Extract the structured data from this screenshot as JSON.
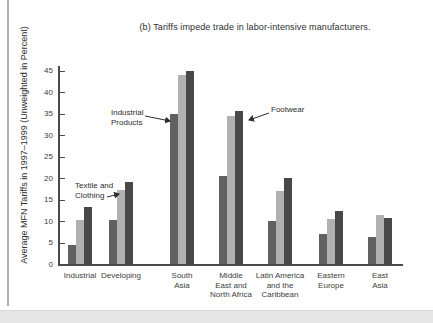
{
  "figure": {
    "title": "(b) Tariffs impede trade in labor-intensive manufacturers."
  },
  "chart_data": {
    "type": "bar",
    "title": "(b) Tariffs impede trade in labor-intensive manufacturers.",
    "xlabel": "",
    "ylabel": "Average MFN Tariffs in 1997–1999 (Unweighted in Percent)",
    "ylim": [
      0,
      45
    ],
    "yticks": [
      0,
      5,
      10,
      15,
      20,
      25,
      30,
      35,
      40,
      45
    ],
    "grid": false,
    "legend_position": "none (labeled by arrow annotations)",
    "categories": [
      "Industrial",
      "Developing",
      "South\nAsia",
      "Middle\nEast and\nNorth Africa",
      "Latin America\nand the\nCaribbean",
      "Eastern\nEurope",
      "East\nAsia"
    ],
    "series": [
      {
        "name": "Industrial Products",
        "color": "#616161",
        "values": [
          4.5,
          10.2,
          35,
          20.5,
          10,
          7,
          6.3
        ]
      },
      {
        "name": "Textile and Clothing",
        "color": "#b1b1b1",
        "values": [
          10.2,
          17.3,
          44,
          34.5,
          17,
          10.5,
          11.3
        ]
      },
      {
        "name": "Footwear",
        "color": "#484848",
        "values": [
          13.2,
          19,
          45,
          35.5,
          20,
          12.3,
          10.8
        ]
      }
    ],
    "annotations": [
      {
        "text": "Industrial\nProducts",
        "points_to": "Industrial Products bar of South Asia"
      },
      {
        "text": "Textile and\nClothing",
        "points_to": "Textile and Clothing bar of Developing"
      },
      {
        "text": "Footwear",
        "points_to": "Footwear bar of Middle East and North Africa"
      }
    ]
  },
  "colors": {
    "axis": "#4a4a4a",
    "text": "#2e2e2e",
    "page_edge": "#b0b0b0",
    "bottom_band": "#e7e7e7"
  }
}
